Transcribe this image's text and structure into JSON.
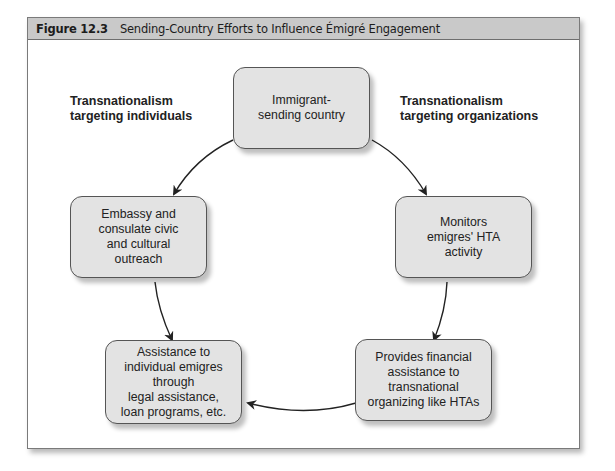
{
  "figure": {
    "number": "Figure 12.3",
    "title": "Sending-Country Efforts to Influence Émigré Engagement"
  },
  "labels": {
    "left": "Transnationalism\ntargeting individuals",
    "right": "Transnationalism\ntargeting organizations"
  },
  "nodes": {
    "top": "Immigrant-\nsending country",
    "left_mid": "Embassy and\nconsulate civic\nand cultural\noutreach",
    "right_mid": "Monitors\nemigres' HTA\nactivity",
    "bottom_left": "Assistance to\nindividual emigres\nthrough\nlegal assistance,\nloan programs, etc.",
    "bottom_right": "Provides financial\nassistance to\ntransnational\norganizing like HTAs"
  },
  "edges": [
    {
      "from": "top",
      "to": "left_mid"
    },
    {
      "from": "top",
      "to": "right_mid"
    },
    {
      "from": "left_mid",
      "to": "bottom_left"
    },
    {
      "from": "right_mid",
      "to": "bottom_right"
    },
    {
      "from": "bottom_right",
      "to": "bottom_left"
    }
  ],
  "colors": {
    "header_bg": "#c9c9c9",
    "box_fill": "#e3e3e3",
    "arrow": "#222222"
  }
}
